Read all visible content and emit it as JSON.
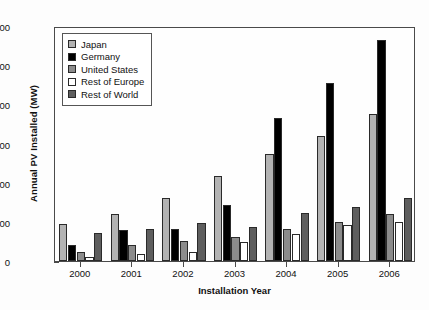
{
  "chart_data": {
    "type": "bar",
    "title": "",
    "xlabel": "Installation Year",
    "ylabel": "Annual PV Installed (MW)",
    "categories": [
      "2000",
      "2001",
      "2002",
      "2003",
      "2004",
      "2005",
      "2006"
    ],
    "ylim": [
      0,
      600
    ],
    "yticks": [
      0,
      100,
      200,
      300,
      400,
      500,
      600
    ],
    "ytick_labels": [
      "0",
      "100",
      "200",
      "300",
      "400",
      "500",
      "600"
    ],
    "grid": false,
    "legend_position": "upper left",
    "series": [
      {
        "name": "Japan",
        "color": "#b3b3b3",
        "values": [
          95,
          120,
          160,
          218,
          272,
          318,
          375
        ]
      },
      {
        "name": "Germany",
        "color": "#000000",
        "values": [
          42,
          78,
          82,
          142,
          365,
          455,
          565
        ]
      },
      {
        "name": "United States",
        "color": "#8c8c8c",
        "values": [
          22,
          40,
          50,
          62,
          82,
          100,
          120
        ]
      },
      {
        "name": "Rest of Europe",
        "color": "#ffffff",
        "values": [
          10,
          18,
          22,
          48,
          70,
          92,
          100
        ]
      },
      {
        "name": "Rest of World",
        "color": "#5e5e5e",
        "values": [
          72,
          82,
          96,
          88,
          122,
          138,
          162
        ]
      }
    ]
  },
  "legend": {
    "items": [
      {
        "label": "Japan"
      },
      {
        "label": "Germany"
      },
      {
        "label": "United States"
      },
      {
        "label": "Rest of Europe"
      },
      {
        "label": "Rest of World"
      }
    ]
  }
}
